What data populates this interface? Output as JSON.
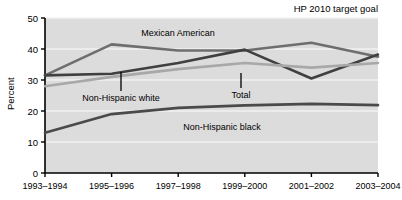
{
  "chart_data": {
    "type": "line",
    "title": "HP 2010 target goal",
    "xlabel": "",
    "ylabel": "Percent",
    "ylim": [
      0,
      50
    ],
    "yticks": [
      0,
      10,
      20,
      30,
      40,
      50
    ],
    "grid": true,
    "legend_position": "inline-annotations",
    "categories": [
      "1993–1994",
      "1995–1996",
      "1997–1998",
      "1999–2000",
      "2001–2002",
      "2003–2004"
    ],
    "series": [
      {
        "name": "Mexican American",
        "values": [
          31.5,
          41.5,
          39.5,
          39.5,
          42.0,
          37.5
        ],
        "color": "#6e6e6e"
      },
      {
        "name": "Non-Hispanic white",
        "values": [
          31.5,
          32.0,
          35.5,
          39.8,
          30.5,
          38.2
        ],
        "color": "#404040"
      },
      {
        "name": "Total",
        "values": [
          28.0,
          31.0,
          33.5,
          35.5,
          34.0,
          35.5
        ],
        "color": "#a8a8a8"
      },
      {
        "name": "Non-Hispanic black",
        "values": [
          13.0,
          19.0,
          21.0,
          21.8,
          22.3,
          21.9
        ],
        "color": "#4a4a4a"
      }
    ],
    "annotations": [
      {
        "label": "Mexican American",
        "x": 178,
        "y": 36
      },
      {
        "label": "Non-Hispanic white",
        "x": 62,
        "y": 99
      },
      {
        "label": "Total",
        "x": 230,
        "y": 95
      },
      {
        "label": "Non-Hispanic black",
        "x": 173,
        "y": 127
      }
    ],
    "goal_label": "HP 2010 target goal",
    "colors": {
      "plot_background": "#dcdcdc",
      "gridline": "#f2f2f2",
      "axis": "#000000",
      "page_background": "#ffffff"
    }
  }
}
